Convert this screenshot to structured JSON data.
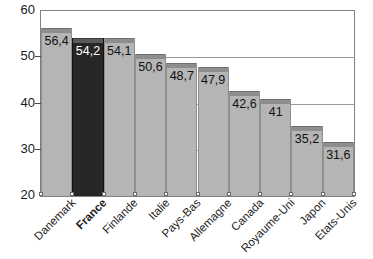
{
  "chart_data": {
    "type": "bar",
    "title": "",
    "subtitle": "",
    "xlabel": "",
    "ylabel": "",
    "ylim": [
      20,
      60
    ],
    "yticks": [
      20,
      30,
      40,
      50,
      60
    ],
    "ytick_labels": [
      "20",
      "30",
      "40",
      "50",
      "60"
    ],
    "grid": true,
    "legend": "none",
    "decimal_separator": ",",
    "highlight_category": "France",
    "colors": {
      "bar": "#b5b5b5",
      "bar_cap": "#8e8e8e",
      "highlight_bar": "#262626",
      "highlight_bar_cap": "#5a5a5a",
      "gridline": "#9a9a9a",
      "frame": "#808080",
      "background": "#ffffff",
      "text": "#1a1a1a",
      "highlight_text": "#ffffff"
    },
    "categories": [
      "Danemark",
      "France",
      "Finlande",
      "Italie",
      "Pays-Bas",
      "Allemagne",
      "Canada",
      "Royaume-Uni",
      "Japon",
      "Etats-Unis"
    ],
    "values": [
      56.4,
      54.2,
      54.1,
      50.6,
      48.7,
      47.9,
      42.6,
      41,
      35.2,
      31.6
    ],
    "value_labels": [
      "56,4",
      "54,2",
      "54,1",
      "50,6",
      "48,7",
      "47,9",
      "42,6",
      "41",
      "35,2",
      "31,6"
    ],
    "bars": [
      {
        "category": "Danemark",
        "value": 56.4,
        "label": "56,4",
        "highlight": false
      },
      {
        "category": "France",
        "value": 54.2,
        "label": "54,2",
        "highlight": true
      },
      {
        "category": "Finlande",
        "value": 54.1,
        "label": "54,1",
        "highlight": false
      },
      {
        "category": "Italie",
        "value": 50.6,
        "label": "50,6",
        "highlight": false
      },
      {
        "category": "Pays-Bas",
        "value": 48.7,
        "label": "48,7",
        "highlight": false
      },
      {
        "category": "Allemagne",
        "value": 47.9,
        "label": "47,9",
        "highlight": false
      },
      {
        "category": "Canada",
        "value": 42.6,
        "label": "42,6",
        "highlight": false
      },
      {
        "category": "Royaume-Uni",
        "value": 41,
        "label": "41",
        "highlight": false
      },
      {
        "category": "Japon",
        "value": 35.2,
        "label": "35,2",
        "highlight": false
      },
      {
        "category": "Etats-Unis",
        "value": 31.6,
        "label": "31,6",
        "highlight": false
      }
    ]
  }
}
